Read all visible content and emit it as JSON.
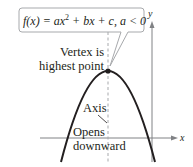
{
  "callout": {
    "equation_prefix": "f(x) = ax",
    "equation_exp": "2",
    "equation_suffix": " + bx + c, a < 0"
  },
  "annotations": {
    "vertex_line1": "Vertex is",
    "vertex_line2": "highest point",
    "axis": "Axis",
    "opens_line1": "Opens",
    "opens_line2": "downward"
  },
  "axes": {
    "x_label": "x",
    "y_label": "y"
  },
  "colors": {
    "curve": "#231f20",
    "axis": "#808285",
    "callout_border": "#a7a9ac",
    "dashed": "#a7a9ac"
  }
}
